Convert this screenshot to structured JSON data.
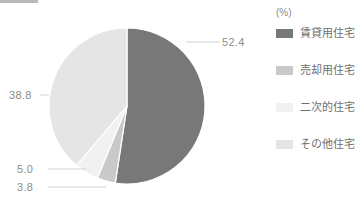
{
  "chart_data": {
    "type": "pie",
    "title": "",
    "unit_label": "(%)",
    "categories": [
      "賃貸用住宅",
      "売却用住宅",
      "二次的住宅",
      "その他住宅"
    ],
    "values": [
      52.4,
      3.8,
      5.0,
      38.8
    ],
    "value_labels": [
      "52.4",
      "3.8",
      "5.0",
      "38.8"
    ],
    "colors": [
      "#787878",
      "#c9c9c9",
      "#f1f1f1",
      "#e5e5e5"
    ],
    "legend_position": "right",
    "grid": false,
    "start_angle_deg": 0,
    "direction": "clockwise"
  },
  "legend": {
    "unit": "(%)",
    "items": [
      {
        "label": "賃貸用住宅",
        "color": "#787878",
        "value": "52.4"
      },
      {
        "label": "売却用住宅",
        "color": "#c9c9c9",
        "value": "3.8"
      },
      {
        "label": "二次的住宅",
        "color": "#f1f1f1",
        "value": "5.0"
      },
      {
        "label": "その他住宅",
        "color": "#e5e5e5",
        "value": "38.8"
      }
    ]
  },
  "callouts": {
    "rental": "52.4",
    "other": "38.8",
    "secondary": "5.0",
    "for_sale": "3.8"
  }
}
